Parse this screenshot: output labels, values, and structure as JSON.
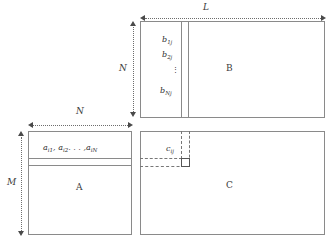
{
  "diagram": {
    "matrices": {
      "A": {
        "letter": "A",
        "row_label": "a",
        "row_elements": "aᵢ₁, aᵢ₂, . . . , aᵢₙ",
        "elements": [
          {
            "base": "a",
            "sub": "i1"
          },
          {
            "base": "a",
            "sub": "i2"
          },
          {
            "base": "a",
            "sub": "iN"
          }
        ],
        "ellipsis": ". . . ,"
      },
      "B": {
        "letter": "B",
        "elements": [
          {
            "base": "b",
            "sub": "1j"
          },
          {
            "base": "b",
            "sub": "2j"
          },
          {
            "base": "b",
            "sub": "Nj"
          }
        ],
        "vdots": "⋮"
      },
      "C": {
        "letter": "C",
        "elements": [
          {
            "base": "c",
            "sub": "ij"
          }
        ]
      }
    },
    "dimensions": [
      {
        "name": "L",
        "label": "L",
        "orientation": "horizontal",
        "applies_to": "B-width"
      },
      {
        "name": "N-vertical",
        "label": "N",
        "orientation": "vertical",
        "applies_to": "B-height"
      },
      {
        "name": "N-horizontal",
        "label": "N",
        "orientation": "horizontal",
        "applies_to": "A-width"
      },
      {
        "name": "M",
        "label": "M",
        "orientation": "vertical",
        "applies_to": "A-height"
      }
    ],
    "colors": {
      "background": "#ffffff",
      "border": "#8a8a8a",
      "guide": "#777777",
      "text": "#2e2e2e",
      "arrow": "#4a4a4a"
    }
  }
}
